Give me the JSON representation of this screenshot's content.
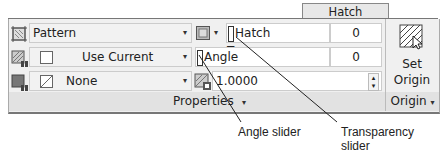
{
  "ribbon": {
    "active_tab": "Hatch Creation"
  },
  "properties_panel": {
    "title": "Properties",
    "title_arrow": "▾",
    "rows": [
      {
        "icon": "hatch-type-icon",
        "value": "Pattern"
      },
      {
        "icon": "hatch-color-icon",
        "value": "Use Current"
      },
      {
        "icon": "background-color-icon",
        "value": "None"
      }
    ],
    "transparency": {
      "label": "Hatch Transparency",
      "value": "0"
    },
    "angle": {
      "label": "Angle",
      "value": "0"
    },
    "scale": {
      "value": "1.0000"
    }
  },
  "origin_panel": {
    "button_line1": "Set",
    "button_line2": "Origin",
    "title": "Origin",
    "title_arrow": "▾"
  },
  "annotations": {
    "angle_slider": "Angle slider",
    "transparency_slider": "Transparency slider"
  },
  "icons": {
    "dropdown": "▾",
    "spin_up": "▴",
    "spin_down": "▾"
  }
}
